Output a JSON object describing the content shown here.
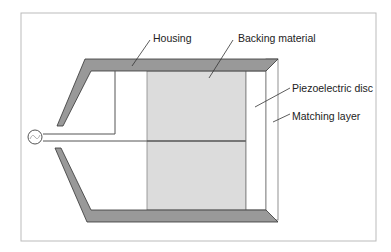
{
  "diagram": {
    "type": "ultrasonic transducer cross-section",
    "labels": {
      "housing": "Housing",
      "backing": "Backing material",
      "piezo": "Piezoelectric disc",
      "matching": "Matching layer"
    },
    "source_symbol": "~",
    "colors": {
      "housing_fill": "#999999",
      "housing_stroke": "#333333",
      "backing_fill": "#dcdcdc",
      "frame": "#bbbbbb",
      "wire": "#555555"
    }
  }
}
